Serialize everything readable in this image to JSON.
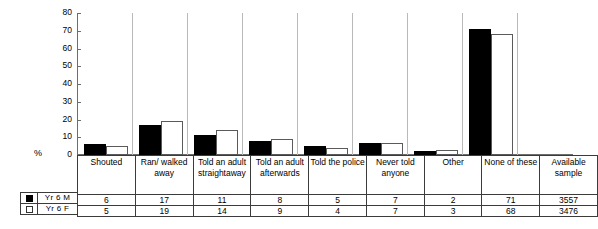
{
  "chart_data": {
    "type": "bar",
    "title": "",
    "xlabel": "",
    "ylabel": "%",
    "ylim": [
      0,
      80
    ],
    "ytick_step": 10,
    "yticks": [
      80,
      70,
      60,
      50,
      40,
      30,
      20,
      10,
      0
    ],
    "grid": false,
    "legend_position": "bottom-left",
    "categories": [
      "Shouted",
      "Ran/ walked away",
      "Told an adult straightaway",
      "Told an adult afterwards",
      "Told the police",
      "Never told anyone",
      "Other",
      "None of these"
    ],
    "series": [
      {
        "name": "Yr 6 M",
        "values": [
          6,
          17,
          11,
          8,
          5,
          7,
          2,
          71
        ],
        "swatch": "filled",
        "color": "#000000"
      },
      {
        "name": "Yr 6 F",
        "values": [
          5,
          19,
          14,
          9,
          4,
          7,
          3,
          68
        ],
        "swatch": "open",
        "color": "#ffffff"
      }
    ],
    "extra_column": {
      "header": "Available sample",
      "values": [
        "3557",
        "3476"
      ]
    }
  },
  "table": {
    "headers": [
      "Shouted",
      "Ran/ walked away",
      "Told an adult straightaway",
      "Told an adult afterwards",
      "Told the police",
      "Never told anyone",
      "Other",
      "None of these",
      "Available sample"
    ],
    "rows": [
      {
        "label": "Yr 6 M",
        "values": [
          "6",
          "17",
          "11",
          "8",
          "5",
          "7",
          "2",
          "71",
          "3557"
        ]
      },
      {
        "label": "Yr 6 F",
        "values": [
          "5",
          "19",
          "14",
          "9",
          "4",
          "7",
          "3",
          "68",
          "3476"
        ]
      }
    ]
  },
  "axis": {
    "y_label": "%",
    "ticks": [
      "80",
      "70",
      "60",
      "50",
      "40",
      "30",
      "20",
      "10",
      "0"
    ]
  },
  "legend": {
    "items": [
      {
        "label": "Yr 6 M",
        "style": "filled"
      },
      {
        "label": "Yr 6 F",
        "style": "open"
      }
    ]
  }
}
